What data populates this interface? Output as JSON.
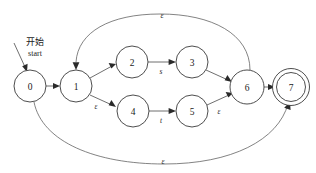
{
  "diagram": {
    "kind": "nfa-state-diagram",
    "title": "",
    "background_color": "#ffffff",
    "stroke_color": "#4a4a4a",
    "text_color": "#1a1a1a",
    "start_marker": {
      "label_cn": "开始",
      "label_en": "start",
      "target_state": "0"
    },
    "states": [
      {
        "id": "s0",
        "label": "0",
        "cx": 30,
        "cy": 86,
        "r": 16,
        "accepting": false
      },
      {
        "id": "s1",
        "label": "1",
        "cx": 76,
        "cy": 86,
        "r": 16,
        "accepting": false
      },
      {
        "id": "s2",
        "label": "2",
        "cx": 132,
        "cy": 62,
        "r": 16,
        "accepting": false
      },
      {
        "id": "s3",
        "label": "3",
        "cx": 192,
        "cy": 62,
        "r": 16,
        "accepting": false
      },
      {
        "id": "s4",
        "label": "4",
        "cx": 133,
        "cy": 111,
        "r": 16,
        "accepting": false
      },
      {
        "id": "s5",
        "label": "5",
        "cx": 192,
        "cy": 111,
        "r": 16,
        "accepting": false
      },
      {
        "id": "s6",
        "label": "6",
        "cx": 247,
        "cy": 87,
        "r": 17,
        "accepting": false
      },
      {
        "id": "s7",
        "label": "7",
        "cx": 291,
        "cy": 87,
        "r": 15,
        "accepting": true
      }
    ],
    "transitions": [
      {
        "from": "0",
        "to": "1",
        "label": "",
        "kind": "straight"
      },
      {
        "from": "1",
        "to": "2",
        "label": "",
        "kind": "straight"
      },
      {
        "from": "2",
        "to": "3",
        "label": "s",
        "kind": "straight"
      },
      {
        "from": "3",
        "to": "6",
        "label": "",
        "kind": "straight"
      },
      {
        "from": "1",
        "to": "4",
        "label": "ε",
        "kind": "straight"
      },
      {
        "from": "4",
        "to": "5",
        "label": "t",
        "kind": "straight"
      },
      {
        "from": "5",
        "to": "6",
        "label": "ε",
        "kind": "straight"
      },
      {
        "from": "6",
        "to": "7",
        "label": "",
        "kind": "straight"
      },
      {
        "from": "6",
        "to": "1",
        "label": "ε",
        "kind": "arc-top"
      },
      {
        "from": "0",
        "to": "7",
        "label": "ε",
        "kind": "arc-bottom"
      }
    ],
    "edge_labels": {
      "top_epsilon": "ε",
      "bottom_epsilon": "ε",
      "one_to_four": "ε",
      "five_to_six": "ε",
      "two_to_three": "s",
      "four_to_five": "t"
    }
  }
}
